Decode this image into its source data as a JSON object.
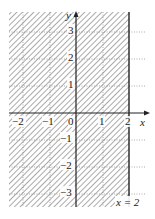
{
  "figure": {
    "boundary_label": "x = 2",
    "axis_labels": {
      "x": "x",
      "y": "y"
    },
    "x_ticks": [
      "−2",
      "−1",
      "0",
      "1",
      "2"
    ],
    "y_ticks": [
      "3",
      "2",
      "1",
      "−1",
      "−2",
      "−3"
    ],
    "origin_label": "0",
    "x_range": [
      -2.5,
      2.6
    ],
    "y_range": [
      -3.5,
      3.7
    ],
    "shaded_region": "x <= 2",
    "colors": {
      "hatch": "#555555",
      "axis": "#222222",
      "grid": "#888888"
    }
  }
}
